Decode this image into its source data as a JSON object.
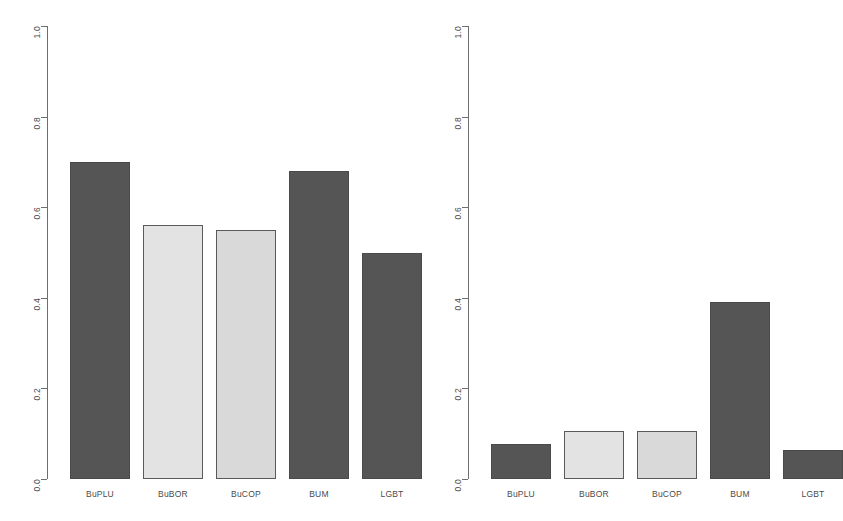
{
  "chart_data": [
    {
      "type": "bar",
      "panel": "left",
      "title": "",
      "xlabel": "",
      "ylabel": "",
      "ylim": [
        0,
        1
      ],
      "yticks": [
        "0.0",
        "0.2",
        "0.4",
        "0.6",
        "0.8",
        "1.0"
      ],
      "ytick_values": [
        0.0,
        0.2,
        0.4,
        0.6,
        0.8,
        1.0
      ],
      "grid": false,
      "legend": "none",
      "categories": [
        "BuPLU",
        "BuBOR",
        "BuCOP",
        "BUM",
        "LGBT"
      ],
      "values": [
        0.7,
        0.56,
        0.55,
        0.68,
        0.5
      ],
      "bar_colors": [
        "#555555",
        "#e3e3e3",
        "#d9d9d9",
        "#555555",
        "#555555"
      ]
    },
    {
      "type": "bar",
      "panel": "right",
      "title": "",
      "xlabel": "",
      "ylabel": "",
      "ylim": [
        0,
        1
      ],
      "yticks": [
        "0.0",
        "0.2",
        "0.4",
        "0.6",
        "0.8",
        "1.0"
      ],
      "ytick_values": [
        0.0,
        0.2,
        0.4,
        0.6,
        0.8,
        1.0
      ],
      "grid": false,
      "legend": "none",
      "categories": [
        "BuPLU",
        "BuBOR",
        "BuCOP",
        "BUM",
        "LGBT"
      ],
      "values": [
        0.077,
        0.105,
        0.105,
        0.39,
        0.064
      ],
      "bar_colors": [
        "#555555",
        "#e3e3e3",
        "#d9d9d9",
        "#555555",
        "#555555"
      ]
    }
  ],
  "colors": {
    "dark_bar": "#555555",
    "light_bar_1": "#e3e3e3",
    "light_bar_2": "#d9d9d9",
    "axis": "#6e6e6e",
    "text": "#4a4a4a",
    "background": "#ffffff"
  }
}
